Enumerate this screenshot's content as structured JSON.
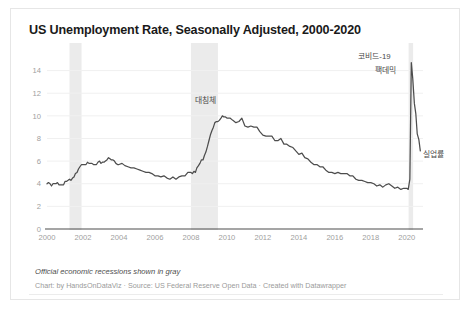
{
  "card": {
    "title": "US Unemployment Rate, Seasonally Adjusted, 2000-2020",
    "note": "Official economic recessions shown in gray",
    "credit": "Chart: by HandsOnDataViz · Source: US Federal Reserve Open Data · Created with Datawrapper"
  },
  "annotations": {
    "covid_line1": "코비드-19",
    "covid_line2": "팩데믹",
    "great_recession": "대침체",
    "series_label": "실업률"
  },
  "colors": {
    "line": "#4d4d4d",
    "recession_band": "#ebebeb",
    "grid": "#f0f0f0",
    "axis": "#4d4d4d",
    "tick_text": "#a0a0a0",
    "title_text": "#1a1a1a",
    "note_text": "#4d4d4d",
    "credit_text": "#9a9a9a",
    "card_bg": "#ffffff",
    "card_border": "#e6e6e6"
  },
  "chart_data": {
    "type": "line",
    "title": "US Unemployment Rate, Seasonally Adjusted, 2000-2020",
    "xlabel": "",
    "ylabel": "",
    "xlim": [
      2000,
      2020.9
    ],
    "ylim": [
      0,
      15.2
    ],
    "grid": true,
    "legend_position": "inline-right",
    "yticks": [
      0,
      2,
      4,
      6,
      8,
      10,
      12,
      14
    ],
    "xticks": [
      2000,
      2002,
      2004,
      2006,
      2008,
      2010,
      2012,
      2014,
      2016,
      2018,
      2020
    ],
    "series": [
      {
        "name": "실업률",
        "x": [
          2000.0,
          2000.08,
          2000.17,
          2000.25,
          2000.33,
          2000.42,
          2000.5,
          2000.58,
          2000.67,
          2000.75,
          2000.83,
          2000.92,
          2001.0,
          2001.08,
          2001.17,
          2001.25,
          2001.33,
          2001.42,
          2001.5,
          2001.58,
          2001.67,
          2001.75,
          2001.83,
          2001.92,
          2002.0,
          2002.08,
          2002.17,
          2002.25,
          2002.33,
          2002.42,
          2002.5,
          2002.58,
          2002.67,
          2002.75,
          2002.83,
          2002.92,
          2003.0,
          2003.08,
          2003.17,
          2003.25,
          2003.33,
          2003.42,
          2003.5,
          2003.58,
          2003.67,
          2003.75,
          2003.83,
          2003.92,
          2004.0,
          2004.17,
          2004.33,
          2004.5,
          2004.67,
          2004.83,
          2005.0,
          2005.17,
          2005.33,
          2005.5,
          2005.67,
          2005.83,
          2006.0,
          2006.17,
          2006.33,
          2006.5,
          2006.67,
          2006.83,
          2007.0,
          2007.17,
          2007.33,
          2007.5,
          2007.67,
          2007.83,
          2008.0,
          2008.08,
          2008.17,
          2008.25,
          2008.33,
          2008.42,
          2008.5,
          2008.58,
          2008.67,
          2008.75,
          2008.83,
          2008.92,
          2009.0,
          2009.08,
          2009.17,
          2009.25,
          2009.33,
          2009.42,
          2009.5,
          2009.58,
          2009.67,
          2009.75,
          2009.83,
          2009.92,
          2010.0,
          2010.17,
          2010.33,
          2010.5,
          2010.67,
          2010.83,
          2011.0,
          2011.17,
          2011.33,
          2011.5,
          2011.67,
          2011.83,
          2012.0,
          2012.17,
          2012.33,
          2012.5,
          2012.67,
          2012.83,
          2013.0,
          2013.17,
          2013.33,
          2013.5,
          2013.67,
          2013.83,
          2014.0,
          2014.17,
          2014.33,
          2014.5,
          2014.67,
          2014.83,
          2015.0,
          2015.17,
          2015.33,
          2015.5,
          2015.67,
          2015.83,
          2016.0,
          2016.17,
          2016.33,
          2016.5,
          2016.67,
          2016.83,
          2017.0,
          2017.17,
          2017.33,
          2017.5,
          2017.67,
          2017.83,
          2018.0,
          2018.17,
          2018.33,
          2018.5,
          2018.67,
          2018.83,
          2019.0,
          2019.17,
          2019.33,
          2019.5,
          2019.67,
          2019.83,
          2020.0,
          2020.08,
          2020.17,
          2020.25,
          2020.33,
          2020.42,
          2020.5,
          2020.58,
          2020.67,
          2020.75
        ],
        "values": [
          4.0,
          4.1,
          4.0,
          3.8,
          4.0,
          4.0,
          4.0,
          4.1,
          3.9,
          3.9,
          3.9,
          3.9,
          4.2,
          4.2,
          4.3,
          4.4,
          4.3,
          4.5,
          4.6,
          4.9,
          5.0,
          5.3,
          5.5,
          5.7,
          5.7,
          5.7,
          5.7,
          5.9,
          5.8,
          5.8,
          5.8,
          5.7,
          5.7,
          5.7,
          5.9,
          6.0,
          5.8,
          5.9,
          5.9,
          6.0,
          6.1,
          6.3,
          6.2,
          6.1,
          6.1,
          6.0,
          5.8,
          5.7,
          5.7,
          5.8,
          5.6,
          5.5,
          5.4,
          5.4,
          5.3,
          5.2,
          5.1,
          5.0,
          5.0,
          4.9,
          4.7,
          4.7,
          4.6,
          4.7,
          4.5,
          4.4,
          4.6,
          4.4,
          4.6,
          4.7,
          4.7,
          5.0,
          5.0,
          4.9,
          5.1,
          5.0,
          5.4,
          5.6,
          5.8,
          6.1,
          6.1,
          6.5,
          6.8,
          7.3,
          7.8,
          8.3,
          8.7,
          9.0,
          9.4,
          9.5,
          9.5,
          9.6,
          9.8,
          10.0,
          9.9,
          9.9,
          9.8,
          9.8,
          9.6,
          9.4,
          9.5,
          9.8,
          9.1,
          9.0,
          9.1,
          9.0,
          9.0,
          8.6,
          8.3,
          8.2,
          8.2,
          8.2,
          7.8,
          7.8,
          8.0,
          7.5,
          7.5,
          7.3,
          7.2,
          6.9,
          6.6,
          6.7,
          6.3,
          6.2,
          5.9,
          5.7,
          5.7,
          5.5,
          5.5,
          5.2,
          5.0,
          5.0,
          4.9,
          5.0,
          4.9,
          4.9,
          4.9,
          4.7,
          4.7,
          4.4,
          4.3,
          4.3,
          4.2,
          4.1,
          4.1,
          4.0,
          3.8,
          3.9,
          3.7,
          3.9,
          4.0,
          3.8,
          3.6,
          3.7,
          3.5,
          3.6,
          3.6,
          3.5,
          4.4,
          14.7,
          13.3,
          11.1,
          10.2,
          8.4,
          7.9,
          6.9
        ]
      }
    ],
    "recession_bands": [
      {
        "start": 2001.25,
        "end": 2001.92,
        "label": ""
      },
      {
        "start": 2008.0,
        "end": 2009.5,
        "label": "대침체"
      },
      {
        "start": 2020.1,
        "end": 2020.35,
        "label": "코비드-19 팩데믹"
      }
    ],
    "annotations": [
      {
        "text": "대침체",
        "x": 2009.4,
        "y": 11.1
      },
      {
        "text": "코비드-19",
        "x": 2019.1,
        "y": 15.0
      },
      {
        "text": "팩데믹",
        "x": 2019.4,
        "y": 13.8
      },
      {
        "text": "실업률",
        "x": 2020.9,
        "y": 6.4
      }
    ]
  }
}
